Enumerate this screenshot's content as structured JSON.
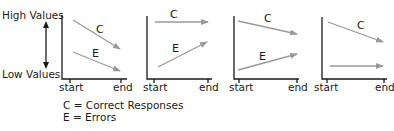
{
  "y_axis": {
    "high_label": "High Values",
    "low_label": "Low Values"
  },
  "x_axis": {
    "start_label": "start",
    "end_label": "end"
  },
  "panels": [
    {
      "id": 1,
      "lines": [
        {
          "series": "C",
          "label": "C",
          "trend": "decreasing"
        },
        {
          "series": "E",
          "label": "E",
          "trend": "decreasing"
        }
      ]
    },
    {
      "id": 2,
      "lines": [
        {
          "series": "C",
          "label": "C",
          "trend": "flat"
        },
        {
          "series": "E",
          "label": "E",
          "trend": "increasing"
        }
      ]
    },
    {
      "id": 3,
      "lines": [
        {
          "series": "C",
          "label": "C",
          "trend": "decreasing"
        },
        {
          "series": "E",
          "label": "E",
          "trend": "increasing"
        }
      ]
    },
    {
      "id": 4,
      "lines": [
        {
          "series": "C",
          "label": "C",
          "trend": "decreasing"
        },
        {
          "series": "E",
          "label": "",
          "trend": "flat"
        }
      ]
    }
  ],
  "legend": {
    "items": [
      {
        "key": "C",
        "text": "C = Correct Responses"
      },
      {
        "key": "E",
        "text": "E = Errors"
      }
    ]
  },
  "colors": {
    "axis": "#1a1a1a",
    "arrow": "#9a9a9a"
  }
}
